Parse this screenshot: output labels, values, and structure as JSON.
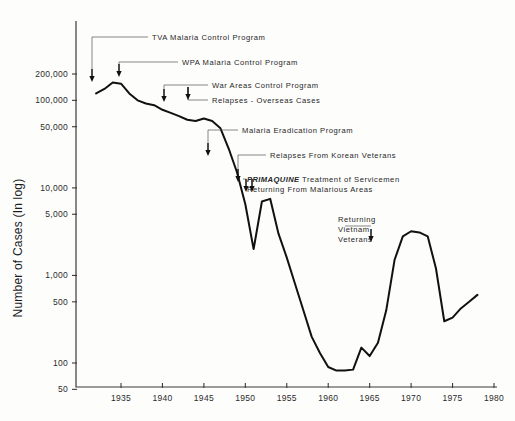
{
  "chart_data": {
    "type": "line",
    "title": "",
    "subtitle": "",
    "xlabel": "",
    "ylabel": "Number of Cases (In log)",
    "scale": "log",
    "grid": false,
    "legend": "none",
    "xlim": [
      1932,
      1980
    ],
    "ylim": [
      50,
      300000
    ],
    "x_ticks": [
      "1935",
      "1940",
      "1945",
      "1950",
      "1955",
      "1960",
      "1965",
      "1970",
      "1975",
      "1980"
    ],
    "x_tick_values": [
      1935,
      1940,
      1945,
      1950,
      1955,
      1960,
      1965,
      1970,
      1975,
      1980
    ],
    "y_ticks": [
      "200,000",
      "100,000",
      "50,000",
      "10,000",
      "5,000",
      "1,000",
      "500",
      "100",
      "50"
    ],
    "y_tick_values": [
      200000,
      100000,
      50000,
      10000,
      5000,
      1000,
      500,
      100,
      50
    ],
    "series": [
      {
        "name": "Reported malaria cases, United States",
        "x": [
          1932,
          1933,
          1934,
          1935,
          1936,
          1937,
          1938,
          1939,
          1940,
          1941,
          1942,
          1943,
          1944,
          1945,
          1946,
          1947,
          1948,
          1949,
          1950,
          1951,
          1952,
          1953,
          1954,
          1955,
          1956,
          1957,
          1958,
          1959,
          1960,
          1961,
          1962,
          1963,
          1964,
          1965,
          1966,
          1967,
          1968,
          1969,
          1970,
          1971,
          1972,
          1973,
          1974,
          1975,
          1976,
          1977,
          1978
        ],
        "values": [
          120000,
          135000,
          160000,
          155000,
          120000,
          100000,
          92000,
          88000,
          78000,
          72000,
          66000,
          60000,
          58000,
          62000,
          58000,
          48000,
          28000,
          15000,
          6500,
          2000,
          7000,
          7500,
          3000,
          1600,
          800,
          400,
          200,
          130,
          90,
          82,
          82,
          84,
          150,
          120,
          170,
          400,
          1500,
          2800,
          3200,
          3100,
          2800,
          1200,
          300,
          330,
          420,
          500,
          600
        ]
      }
    ],
    "annotations": [
      {
        "id": "tva",
        "text": "TVA  Malaria  Control  Program",
        "year": 1933,
        "italic_prefix": ""
      },
      {
        "id": "wpa",
        "text": "WPA  Malaria  Control  Program",
        "year": 1935,
        "italic_prefix": ""
      },
      {
        "id": "war-areas",
        "text": "War  Areas  Control  Program",
        "year": 1942,
        "italic_prefix": ""
      },
      {
        "id": "relapses-overseas",
        "text": "Relapses - Overseas  Cases",
        "year": 1945,
        "italic_prefix": ""
      },
      {
        "id": "eradication",
        "text": "Malaria Eradication Program",
        "year": 1947,
        "italic_prefix": ""
      },
      {
        "id": "relapses-korean",
        "text": "Relapses From Korean  Veterans",
        "year": 1951,
        "italic_prefix": ""
      },
      {
        "id": "primaquine",
        "text": "Treatment of Servicemen",
        "text_line2": "Returning From Malarious Areas",
        "year": 1952,
        "italic_prefix": "PRIMAQUINE"
      },
      {
        "id": "vietnam",
        "text": "Returning",
        "text_line2": "Vietnam",
        "text_line3": "Veterans",
        "year": 1967,
        "italic_prefix": ""
      }
    ],
    "colors": {
      "curve": "#111111",
      "axis": "#3a3a3a",
      "leader": "#555555",
      "background": "#fdfdfc"
    }
  }
}
